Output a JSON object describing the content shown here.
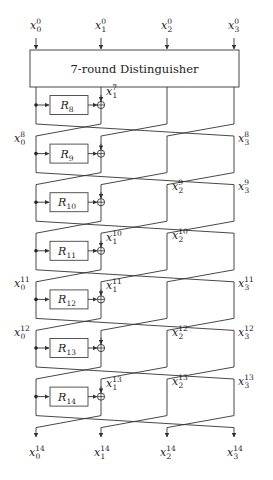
{
  "diagram": {
    "title": "7-round Distinguisher",
    "inputs": [
      {
        "base": "x",
        "sub": "0",
        "sup": "0"
      },
      {
        "base": "x",
        "sub": "1",
        "sup": "0"
      },
      {
        "base": "x",
        "sub": "2",
        "sup": "0"
      },
      {
        "base": "x",
        "sub": "3",
        "sup": "0"
      }
    ],
    "outputs": [
      {
        "base": "x",
        "sub": "0",
        "sup": "14"
      },
      {
        "base": "x",
        "sub": "1",
        "sup": "14"
      },
      {
        "base": "x",
        "sub": "2",
        "sup": "14"
      },
      {
        "base": "x",
        "sub": "3",
        "sup": "14"
      }
    ],
    "rounds": [
      {
        "name": "R",
        "index": "8",
        "labels": [
          {
            "pos": 1,
            "sub": "1",
            "sup": "7"
          }
        ]
      },
      {
        "name": "R",
        "index": "9",
        "labels": [
          {
            "pos": 0,
            "sub": "0",
            "sup": "8"
          },
          {
            "pos": 3,
            "sub": "3",
            "sup": "8"
          }
        ]
      },
      {
        "name": "R",
        "index": "10",
        "labels": [
          {
            "pos": 2,
            "sub": "2",
            "sup": "9"
          },
          {
            "pos": 3,
            "sub": "3",
            "sup": "9"
          }
        ]
      },
      {
        "name": "R",
        "index": "11",
        "labels": [
          {
            "pos": 1,
            "sub": "1",
            "sup": "10"
          },
          {
            "pos": 2,
            "sub": "2",
            "sup": "10"
          }
        ]
      },
      {
        "name": "R",
        "index": "12",
        "labels": [
          {
            "pos": 0,
            "sub": "0",
            "sup": "11"
          },
          {
            "pos": 1,
            "sub": "1",
            "sup": "11"
          },
          {
            "pos": 3,
            "sub": "3",
            "sup": "11"
          }
        ]
      },
      {
        "name": "R",
        "index": "13",
        "labels": [
          {
            "pos": 0,
            "sub": "0",
            "sup": "12"
          },
          {
            "pos": 2,
            "sub": "2",
            "sup": "12"
          },
          {
            "pos": 3,
            "sub": "3",
            "sup": "12"
          }
        ]
      },
      {
        "name": "R",
        "index": "14",
        "labels": [
          {
            "pos": 1,
            "sub": "1",
            "sup": "13"
          },
          {
            "pos": 2,
            "sub": "2",
            "sup": "13"
          },
          {
            "pos": 3,
            "sub": "3",
            "sup": "13"
          }
        ]
      }
    ],
    "colors": {
      "line": "#333333",
      "box_border": "#444444",
      "text": "#222222",
      "background": "#ffffff"
    }
  }
}
